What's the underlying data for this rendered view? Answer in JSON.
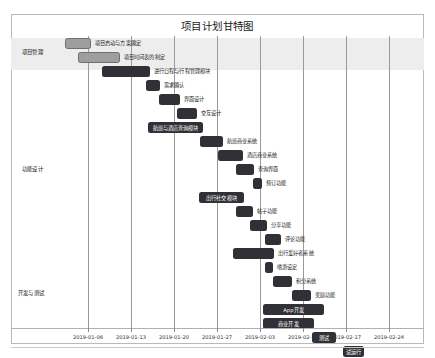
{
  "chart_data": {
    "type": "bar",
    "subtype": "gantt",
    "title": "项目计划甘特图",
    "xlabel": "",
    "ylabel": "",
    "grid": true,
    "legend": false,
    "xlim": [
      "2019-01-02",
      "2019-02-28"
    ],
    "x_tick_labels": [
      "2019-01-06",
      "2019-01-13",
      "2019-01-20",
      "2019-01-27",
      "2019-02-03",
      "2019-02-10",
      "2019-02-17",
      "2019-02-24"
    ],
    "categories": [
      "项目管理",
      "功能设计",
      "开发与测试"
    ],
    "tasks": [
      {
        "name": "项目启动与方案确定",
        "category": "项目管理",
        "start": "2019-01-02",
        "end": "2019-01-06",
        "color": "#9e9e9e",
        "label_position": "right"
      },
      {
        "name": "项目时间表的制定",
        "category": "项目管理",
        "start": "2019-01-05",
        "end": "2019-01-12",
        "color": "#9e9e9e",
        "label_position": "right"
      },
      {
        "name": "进行日程与行程管理模块",
        "category": "功能设计",
        "start": "2019-01-09",
        "end": "2019-01-17",
        "color": "#2f3136",
        "label_position": "right"
      },
      {
        "name": "需求确认",
        "category": "功能设计",
        "start": "2019-01-16",
        "end": "2019-01-18",
        "color": "#2f3136",
        "label_position": "right"
      },
      {
        "name": "界面设计",
        "category": "功能设计",
        "start": "2019-01-18",
        "end": "2019-01-21",
        "color": "#2f3136",
        "label_position": "right"
      },
      {
        "name": "交互设计",
        "category": "功能设计",
        "start": "2019-01-20",
        "end": "2019-01-23",
        "color": "#2f3136",
        "label_position": "right"
      },
      {
        "name": "航班与酒店查询模块",
        "category": "功能设计",
        "start": "2019-01-16",
        "end": "2019-01-24",
        "color": "#2f3136",
        "label_position": "inside"
      },
      {
        "name": "航班商业系统",
        "category": "功能设计",
        "start": "2019-01-23",
        "end": "2019-01-27",
        "color": "#2f3136",
        "label_position": "right"
      },
      {
        "name": "酒店商业系统",
        "category": "功能设计",
        "start": "2019-01-26",
        "end": "2019-01-30",
        "color": "#2f3136",
        "label_position": "right"
      },
      {
        "name": "查询界面",
        "category": "功能设计",
        "start": "2019-01-29",
        "end": "2019-02-01",
        "color": "#2f3136",
        "label_position": "right"
      },
      {
        "name": "预订功能",
        "category": "功能设计",
        "start": "2019-02-01",
        "end": "2019-02-02",
        "color": "#2f3136",
        "label_position": "right"
      },
      {
        "name": "出行社交模块",
        "category": "功能设计",
        "start": "2019-01-23",
        "end": "2019-02-01",
        "color": "#2f3136",
        "label_position": "inside"
      },
      {
        "name": "帖子功能",
        "category": "功能设计",
        "start": "2019-01-30",
        "end": "2019-02-02",
        "color": "#2f3136",
        "label_position": "right"
      },
      {
        "name": "分享功能",
        "category": "功能设计",
        "start": "2019-02-01",
        "end": "2019-02-04",
        "color": "#2f3136",
        "label_position": "right"
      },
      {
        "name": "评论功能",
        "category": "功能设计",
        "start": "2019-02-03",
        "end": "2019-02-05",
        "color": "#2f3136",
        "label_position": "right"
      },
      {
        "name": "出行爱好者系统",
        "category": "功能设计",
        "start": "2019-01-30",
        "end": "2019-02-05",
        "color": "#2f3136",
        "label_position": "right"
      },
      {
        "name": "嗜游设定",
        "category": "功能设计",
        "start": "2019-02-04",
        "end": "2019-02-05",
        "color": "#2f3136",
        "label_position": "right"
      },
      {
        "name": "积分系统",
        "category": "功能设计",
        "start": "2019-02-05",
        "end": "2019-02-07",
        "color": "#2f3136",
        "label_position": "right"
      },
      {
        "name": "奖励功能",
        "category": "功能设计",
        "start": "2019-02-07",
        "end": "2019-02-09",
        "color": "#2f3136",
        "label_position": "right"
      },
      {
        "name": "App开发",
        "category": "开发与测试",
        "start": "2019-02-04",
        "end": "2019-02-12",
        "color": "#2f3136",
        "label_position": "inside"
      },
      {
        "name": "商业开发",
        "category": "开发与测试",
        "start": "2019-02-04",
        "end": "2019-02-11",
        "color": "#2f3136",
        "label_position": "inside"
      },
      {
        "name": "测试",
        "category": "开发与测试",
        "start": "2019-02-12",
        "end": "2019-02-15",
        "color": "#2f3136",
        "label_position": "inside"
      },
      {
        "name": "试运行",
        "category": "开发与测试",
        "start": "2019-02-15",
        "end": "2019-02-18",
        "color": "#2f3136",
        "label_position": "inside"
      },
      {
        "name": "上线",
        "category": "开发与测试",
        "start": "2019-02-18",
        "end": "2019-02-20",
        "color": "#2f3136",
        "label_position": "inside"
      }
    ]
  },
  "layout": {
    "gridline_x": [
      88,
      131,
      174,
      217,
      260,
      303,
      346,
      389
    ],
    "tick_label_x": [
      88,
      131,
      174,
      217,
      260,
      303,
      346,
      389
    ],
    "band": {
      "top": 38,
      "height": 32
    },
    "category_positions": [
      {
        "label": "项目管理",
        "x": 22,
        "y": 48
      },
      {
        "label": "功能设计",
        "x": 22,
        "y": 165
      },
      {
        "label": "开发与测试",
        "x": 18,
        "y": 289
      }
    ],
    "bars": [
      {
        "left": 5,
        "top": 2,
        "width": 26,
        "variant": "light",
        "label_side": "right",
        "label_dx": 30
      },
      {
        "left": 18,
        "top": 16,
        "width": 42,
        "variant": "light",
        "label_side": "right",
        "label_dx": 46
      },
      {
        "left": 42,
        "top": 30,
        "width": 48,
        "variant": "dark",
        "label_side": "right",
        "label_dx": 52
      },
      {
        "left": 86,
        "top": 44,
        "width": 14,
        "variant": "dark",
        "label_side": "right",
        "label_dx": 18
      },
      {
        "left": 99,
        "top": 58,
        "width": 21,
        "variant": "dark",
        "label_side": "right",
        "label_dx": 25
      },
      {
        "left": 117,
        "top": 72,
        "width": 20,
        "variant": "dark",
        "label_side": "right",
        "label_dx": 24
      },
      {
        "left": 88,
        "top": 86,
        "width": 55,
        "variant": "dark",
        "label_side": "inside",
        "label_dx": 0
      },
      {
        "left": 140,
        "top": 100,
        "width": 23,
        "variant": "dark",
        "label_side": "right",
        "label_dx": 27
      },
      {
        "left": 158,
        "top": 114,
        "width": 25,
        "variant": "dark",
        "label_side": "right",
        "label_dx": 29
      },
      {
        "left": 176,
        "top": 128,
        "width": 18,
        "variant": "dark",
        "label_side": "right",
        "label_dx": 22
      },
      {
        "left": 193,
        "top": 142,
        "width": 9,
        "variant": "dark",
        "label_side": "right",
        "label_dx": 13
      },
      {
        "left": 139,
        "top": 156,
        "width": 45,
        "variant": "dark",
        "label_side": "inside",
        "label_dx": 0
      },
      {
        "left": 176,
        "top": 170,
        "width": 17,
        "variant": "dark",
        "label_side": "right",
        "label_dx": 21
      },
      {
        "left": 190,
        "top": 184,
        "width": 17,
        "variant": "dark",
        "label_side": "right",
        "label_dx": 21
      },
      {
        "left": 205,
        "top": 198,
        "width": 16,
        "variant": "dark",
        "label_side": "right",
        "label_dx": 20
      },
      {
        "left": 173,
        "top": 212,
        "width": 41,
        "variant": "dark",
        "label_side": "right",
        "label_dx": 45
      },
      {
        "left": 205,
        "top": 226,
        "width": 8,
        "variant": "dark",
        "label_side": "right",
        "label_dx": 12
      },
      {
        "left": 213,
        "top": 240,
        "width": 19,
        "variant": "dark",
        "label_side": "right",
        "label_dx": 23
      },
      {
        "left": 232,
        "top": 254,
        "width": 19,
        "variant": "dark",
        "label_side": "right",
        "label_dx": 23
      },
      {
        "left": 203,
        "top": 268,
        "width": 61,
        "variant": "dark",
        "label_side": "inside",
        "label_dx": 0
      },
      {
        "left": 203,
        "top": 282,
        "width": 51,
        "variant": "dark",
        "label_side": "inside",
        "label_dx": 0
      },
      {
        "left": 252,
        "top": 296,
        "width": 24,
        "variant": "dark",
        "label_side": "inside",
        "label_dx": 0
      },
      {
        "left": 283,
        "top": 310,
        "width": 21,
        "variant": "dark",
        "label_side": "inside",
        "label_dx": 0
      },
      {
        "left": 316,
        "top": 324,
        "width": 14,
        "variant": "dark",
        "label_side": "inside",
        "label_dx": 0
      }
    ]
  }
}
